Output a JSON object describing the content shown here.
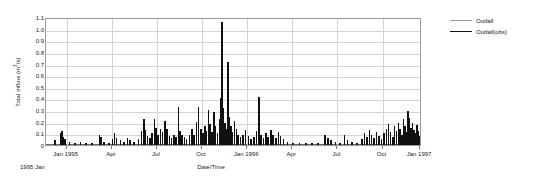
{
  "chart_data": {
    "type": "bar",
    "title": "",
    "subtitle": "",
    "xlabel": "Date/Time",
    "ylabel": "Total inflow (m3/s)",
    "ylabel_base": "Total inflow (m",
    "ylabel_sup": "3",
    "ylabel_tail": "/s)",
    "origin_note": "1995 Jan",
    "grid": true,
    "legend_position": "right",
    "ylim": [
      0,
      1.1
    ],
    "ytick_labels": [
      "1.1",
      "1.0",
      "0.9",
      "0.8",
      "0.7",
      "0.6",
      "0.5",
      "0.4",
      "0.3",
      "0.2",
      "0.1",
      "0"
    ],
    "ytick_values": [
      1.1,
      1.0,
      0.9,
      0.8,
      0.7,
      0.6,
      0.5,
      0.4,
      0.3,
      0.2,
      0.1,
      0
    ],
    "xtick_labels": [
      "Jan 1995",
      "Apr",
      "Jul",
      "Oct",
      "Jan 1996",
      "Apr",
      "Jul",
      "Oct",
      "Jan 1997"
    ],
    "xtick_positions": [
      0.055,
      0.175,
      0.295,
      0.415,
      0.535,
      0.655,
      0.775,
      0.895,
      0.995
    ],
    "xlim_labels": [
      "1995 Jan",
      "1997 Jan"
    ],
    "series": [
      {
        "name": "Outfall",
        "color": "#9a9a9a",
        "line_width": 1,
        "values": []
      },
      {
        "name": "Outfall(obs)",
        "color": "#111111",
        "line_width": 1.6,
        "values": [
          [
            0.022,
            0.04
          ],
          [
            0.036,
            0.1
          ],
          [
            0.04,
            0.12
          ],
          [
            0.044,
            0.07
          ],
          [
            0.048,
            0.05
          ],
          [
            0.06,
            0.03
          ],
          [
            0.075,
            0.02
          ],
          [
            0.09,
            0.03
          ],
          [
            0.105,
            0.02
          ],
          [
            0.12,
            0.015
          ],
          [
            0.14,
            0.09
          ],
          [
            0.144,
            0.07
          ],
          [
            0.152,
            0.03
          ],
          [
            0.166,
            0.02
          ],
          [
            0.175,
            0.05
          ],
          [
            0.18,
            0.1
          ],
          [
            0.185,
            0.06
          ],
          [
            0.196,
            0.04
          ],
          [
            0.205,
            0.03
          ],
          [
            0.215,
            0.06
          ],
          [
            0.222,
            0.04
          ],
          [
            0.232,
            0.03
          ],
          [
            0.244,
            0.05
          ],
          [
            0.252,
            0.12
          ],
          [
            0.258,
            0.22
          ],
          [
            0.263,
            0.13
          ],
          [
            0.268,
            0.08
          ],
          [
            0.274,
            0.06
          ],
          [
            0.28,
            0.1
          ],
          [
            0.286,
            0.22
          ],
          [
            0.291,
            0.15
          ],
          [
            0.296,
            0.09
          ],
          [
            0.302,
            0.14
          ],
          [
            0.308,
            0.11
          ],
          [
            0.314,
            0.21
          ],
          [
            0.32,
            0.14
          ],
          [
            0.326,
            0.08
          ],
          [
            0.332,
            0.06
          ],
          [
            0.338,
            0.09
          ],
          [
            0.344,
            0.07
          ],
          [
            0.35,
            0.33
          ],
          [
            0.354,
            0.12
          ],
          [
            0.36,
            0.09
          ],
          [
            0.366,
            0.07
          ],
          [
            0.372,
            0.05
          ],
          [
            0.38,
            0.09
          ],
          [
            0.386,
            0.14
          ],
          [
            0.392,
            0.09
          ],
          [
            0.398,
            0.2
          ],
          [
            0.404,
            0.33
          ],
          [
            0.41,
            0.14
          ],
          [
            0.415,
            0.1
          ],
          [
            0.42,
            0.16
          ],
          [
            0.425,
            0.12
          ],
          [
            0.43,
            0.3
          ],
          [
            0.434,
            0.18
          ],
          [
            0.439,
            0.11
          ],
          [
            0.444,
            0.28
          ],
          [
            0.449,
            0.16
          ],
          [
            0.454,
            0.1
          ],
          [
            0.459,
            0.22
          ],
          [
            0.463,
            0.4
          ],
          [
            0.466,
            1.06
          ],
          [
            0.47,
            0.32
          ],
          [
            0.474,
            0.19
          ],
          [
            0.478,
            0.14
          ],
          [
            0.482,
            0.71
          ],
          [
            0.486,
            0.24
          ],
          [
            0.49,
            0.16
          ],
          [
            0.494,
            0.11
          ],
          [
            0.499,
            0.21
          ],
          [
            0.504,
            0.14
          ],
          [
            0.509,
            0.09
          ],
          [
            0.515,
            0.07
          ],
          [
            0.522,
            0.09
          ],
          [
            0.529,
            0.13
          ],
          [
            0.536,
            0.08
          ],
          [
            0.543,
            0.05
          ],
          [
            0.551,
            0.07
          ],
          [
            0.558,
            0.12
          ],
          [
            0.565,
            0.41
          ],
          [
            0.57,
            0.09
          ],
          [
            0.576,
            0.06
          ],
          [
            0.583,
            0.1
          ],
          [
            0.589,
            0.07
          ],
          [
            0.596,
            0.13
          ],
          [
            0.602,
            0.09
          ],
          [
            0.609,
            0.06
          ],
          [
            0.616,
            0.11
          ],
          [
            0.622,
            0.08
          ],
          [
            0.629,
            0.05
          ],
          [
            0.64,
            0.03
          ],
          [
            0.655,
            0.02
          ],
          [
            0.672,
            0.015
          ],
          [
            0.69,
            0.02
          ],
          [
            0.705,
            0.015
          ],
          [
            0.722,
            0.02
          ],
          [
            0.74,
            0.09
          ],
          [
            0.748,
            0.06
          ],
          [
            0.756,
            0.04
          ],
          [
            0.768,
            0.03
          ],
          [
            0.78,
            0.02
          ],
          [
            0.792,
            0.09
          ],
          [
            0.8,
            0.04
          ],
          [
            0.812,
            0.03
          ],
          [
            0.825,
            0.02
          ],
          [
            0.838,
            0.05
          ],
          [
            0.845,
            0.1
          ],
          [
            0.852,
            0.07
          ],
          [
            0.858,
            0.13
          ],
          [
            0.864,
            0.09
          ],
          [
            0.87,
            0.06
          ],
          [
            0.877,
            0.11
          ],
          [
            0.884,
            0.08
          ],
          [
            0.89,
            0.05
          ],
          [
            0.897,
            0.1
          ],
          [
            0.903,
            0.14
          ],
          [
            0.909,
            0.18
          ],
          [
            0.914,
            0.11
          ],
          [
            0.92,
            0.07
          ],
          [
            0.925,
            0.16
          ],
          [
            0.93,
            0.12
          ],
          [
            0.935,
            0.19
          ],
          [
            0.94,
            0.14
          ],
          [
            0.944,
            0.09
          ],
          [
            0.949,
            0.22
          ],
          [
            0.953,
            0.16
          ],
          [
            0.957,
            0.11
          ],
          [
            0.961,
            0.29
          ],
          [
            0.965,
            0.23
          ],
          [
            0.969,
            0.15
          ],
          [
            0.973,
            0.19
          ],
          [
            0.977,
            0.13
          ],
          [
            0.981,
            0.1
          ],
          [
            0.985,
            0.17
          ],
          [
            0.988,
            0.12
          ],
          [
            0.992,
            0.08
          ],
          [
            0.996,
            0.11
          ],
          [
            1.0,
            0.07
          ]
        ]
      }
    ],
    "legend_entries": [
      {
        "label": "Outfall",
        "color": "#9a9a9a"
      },
      {
        "label": "Outfall(obs)",
        "color": "#111111"
      }
    ]
  }
}
